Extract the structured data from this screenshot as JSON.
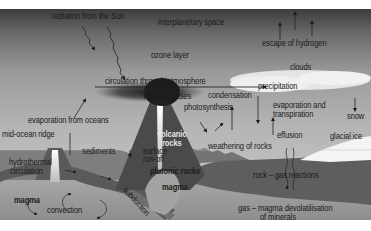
{
  "diagram": {
    "labels": {
      "radiation": "radiation from the Sun",
      "interplanetary": "interplanetary space",
      "escape_hydrogen": "escape of hydrogen",
      "ozone": "ozone layer",
      "clouds": "clouds",
      "circulation": "circulation through atmosphere",
      "precipitation": "precipitation",
      "volcanic_gases": "volcanic gases",
      "condensation": "condensation",
      "photosynthesis": "photosynthesis",
      "evaporation_oceans": "evaporation from oceans",
      "evap_transp_1": "evaporation and",
      "evap_transp_2": "transpiration",
      "snow": "snow",
      "mid_ocean_ridge": "mid-ocean ridge",
      "volcanic_rocks_1": "volcanic",
      "volcanic_rocks_2": "rocks",
      "effusion": "effusion",
      "glacial_ice": "glacial ice",
      "weathering": "weathering of rocks",
      "sediments": "sediments",
      "surface_runoff_1": "surface",
      "surface_runoff_2": "run-off",
      "hydrothermal_1": "hydrothermal",
      "hydrothermal_2": "circulation",
      "plutonic_rocks": "plutonic rocks",
      "rock_gas": "rock – gas reactions",
      "magma_left": "magma",
      "magma_center": "magma",
      "subduction": "subduction",
      "convection": "convection",
      "devolatilisation_1": "gas – magma devolatilisation",
      "devolatilisation_2": "of minerals"
    },
    "colors": {
      "space_top": "#3a3a3a",
      "sky_mid": "#9a9a9a",
      "sky_low": "#c8c8c8",
      "land": "#5a5a5a",
      "ocean": "#8a8a8a",
      "mantle": "#9c9c9c",
      "crust_plate": "#6a6a6a",
      "ice": "#f2f2f2",
      "cloud": "#eeeeee"
    }
  }
}
